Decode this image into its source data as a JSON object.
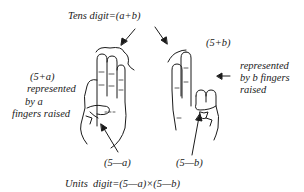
{
  "diagram": {
    "title_top": "Tens digit=(a+b)",
    "left_hand": {
      "label_line1": "(5+a)",
      "label_line2": "represented",
      "label_line3": "by a",
      "label_line4": "fingers raised",
      "bottom_label": "(5—a)"
    },
    "right_hand": {
      "label_top": "(5+b)",
      "label_line1": "represented",
      "label_line2": "by b fingers",
      "label_line3": "raised",
      "bottom_label": "(5—b)"
    },
    "formula_bottom": "Units  digit=(5—a)×(5—b)",
    "stroke_color": "#1a1a1a",
    "background": "#ffffff"
  }
}
